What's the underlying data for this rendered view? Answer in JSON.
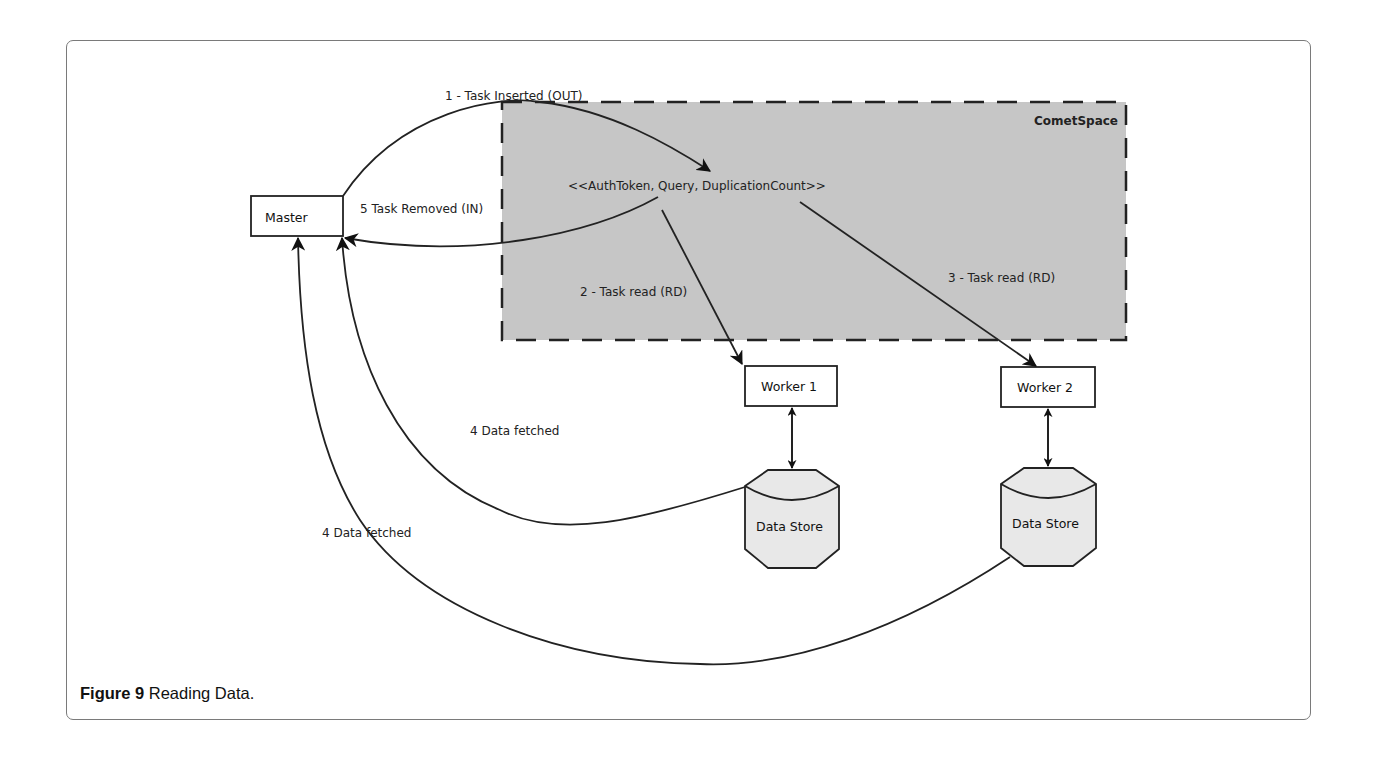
{
  "figure": {
    "caption_label": "Figure 9",
    "caption_text": " Reading Data."
  },
  "space": {
    "title": "CometSpace",
    "tuple": "<<AuthToken, Query, DuplicationCount>>",
    "fill_color": "#c6c6c6"
  },
  "nodes": {
    "master": "Master",
    "worker1": "Worker 1",
    "worker2": "Worker 2",
    "datastore1": "Data Store",
    "datastore2": "Data Store"
  },
  "edges": {
    "task_inserted": "1 - Task Inserted (OUT)",
    "task_read_1": "2 - Task read (RD)",
    "task_read_2": "3 - Task read (RD)",
    "data_fetched_1": "4 Data fetched",
    "data_fetched_2": "4 Data fetched",
    "task_removed": "5 Task Removed (IN)"
  }
}
